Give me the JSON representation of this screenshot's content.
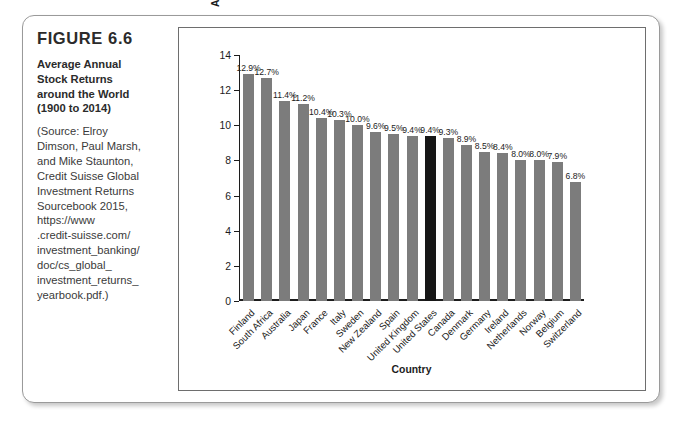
{
  "figure": {
    "number": "FIGURE 6.6",
    "title_lines": [
      "Average Annual",
      "Stock Returns",
      "around the World",
      "(1900 to 2014)"
    ],
    "title_text": "Average Annual Stock Returns around the World (1900 to 2014)",
    "source_lines": [
      "(Source: Elroy",
      "Dimson, Paul Marsh,",
      "and Mike Staunton,",
      "Credit Suisse Global",
      "Investment Returns",
      "Sourcebook 2015,",
      "https://www",
      ".credit-suisse.com/",
      "investment_banking/",
      "doc/cs_global_",
      "investment_returns_",
      "yearbook.pdf.)"
    ]
  },
  "colors": {
    "bar": "#7c7c7c",
    "bar_highlight": "#161616",
    "axis": "#1c1c1c",
    "card_border": "#9a9a9a"
  },
  "chart_data": {
    "type": "bar",
    "xlabel": "Country",
    "ylabel": "Average Annual Stock Return",
    "ylim": [
      0,
      14
    ],
    "yticks": [
      0,
      2,
      4,
      6,
      8,
      10,
      12,
      14
    ],
    "grid": false,
    "legend": "none",
    "value_suffix": "%",
    "highlight_category": "United States",
    "categories": [
      "Finland",
      "South Africa",
      "Australia",
      "Japan",
      "France",
      "Italy",
      "Sweden",
      "New Zealand",
      "Spain",
      "United Kingdom",
      "United States",
      "Canada",
      "Denmark",
      "Germany",
      "Ireland",
      "Netherlands",
      "Norway",
      "Belgium",
      "Switzerland"
    ],
    "values": [
      12.9,
      12.7,
      11.4,
      11.2,
      10.4,
      10.3,
      10.0,
      9.6,
      9.5,
      9.4,
      9.4,
      9.3,
      8.9,
      8.5,
      8.4,
      8.0,
      8.0,
      7.9,
      6.8
    ],
    "value_labels": [
      "12.9%",
      "12.7%",
      "11.4%",
      "11.2%",
      "10.4%",
      "10.3%",
      "10.0%",
      "9.6%",
      "9.5%",
      "9.4%",
      "9.4%",
      "9.3%",
      "8.9%",
      "8.5%",
      "8.4%",
      "8.0%",
      "8.0%",
      "7.9%",
      "6.8%"
    ]
  }
}
